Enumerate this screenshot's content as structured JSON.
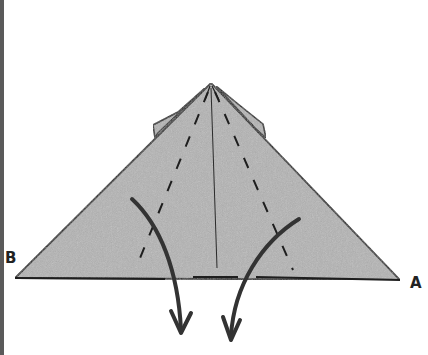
{
  "diagram": {
    "type": "origami-fold-instruction",
    "labels": {
      "corner_left": "B",
      "corner_right": "A"
    },
    "colors": {
      "paper_fill": "#b4b4b4",
      "outline": "#1e1e1e",
      "arrow": "#333333",
      "border": "#5a5a5a",
      "background": "#ffffff"
    },
    "elements": {
      "paper_shape": "triangle",
      "fold_lines": [
        "left-dashed-valley-fold",
        "right-dashed-valley-fold"
      ],
      "crease": "center-vertical-crease",
      "arrows": [
        "left-fold-down-arrow",
        "right-fold-down-arrow"
      ],
      "flaps": [
        "left-back-flap",
        "right-back-flap"
      ]
    }
  }
}
